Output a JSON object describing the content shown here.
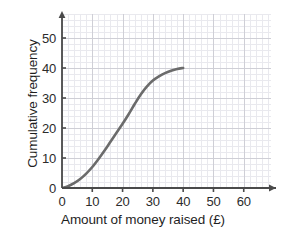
{
  "chart_data": {
    "type": "line",
    "title": "",
    "subtitle": "",
    "xlabel": "Amount of money raised (£)",
    "ylabel": "Cumulative frequency",
    "xlim": [
      0,
      69
    ],
    "ylim": [
      0,
      58
    ],
    "x_ticks": [
      0,
      10,
      20,
      30,
      40,
      50,
      60
    ],
    "y_ticks": [
      0,
      10,
      20,
      30,
      40,
      50
    ],
    "x_tick_labels": [
      "0",
      "10",
      "20",
      "30",
      "40",
      "50",
      "60"
    ],
    "y_tick_labels": [
      "0",
      "10",
      "20",
      "30",
      "40",
      "50"
    ],
    "x_minor_step": 2,
    "y_minor_step": 2,
    "grid": true,
    "legend": false,
    "legend_position": "none",
    "series": [
      {
        "name": "Cumulative frequency",
        "color": "#6b6b6b",
        "line_width": 2.6,
        "x": [
          0,
          2,
          4,
          6,
          8,
          10,
          12,
          14,
          16,
          18,
          20,
          22,
          24,
          26,
          28,
          30,
          32,
          34,
          36,
          38,
          40
        ],
        "y": [
          0,
          0.6,
          1.6,
          3.0,
          4.8,
          7.0,
          9.6,
          12.4,
          15.4,
          18.4,
          21.4,
          24.6,
          28.0,
          31.2,
          33.8,
          35.8,
          37.2,
          38.3,
          39.1,
          39.7,
          40.0
        ]
      }
    ],
    "colors": {
      "curve": "#6b6b6b",
      "axis": "#4a4a4a",
      "major_grid": "#cfcfd6",
      "minor_grid": "#e9e9ee",
      "text": "#2b2b2b",
      "background": "#ffffff"
    },
    "annotations": []
  },
  "axes": {
    "x_title": "Amount of money raised (£)",
    "y_title": "Cumulative frequency",
    "x_labels": [
      "0",
      "10",
      "20",
      "30",
      "40",
      "50",
      "60"
    ],
    "y_labels": [
      "50",
      "40",
      "30",
      "20",
      "10",
      "0"
    ]
  }
}
